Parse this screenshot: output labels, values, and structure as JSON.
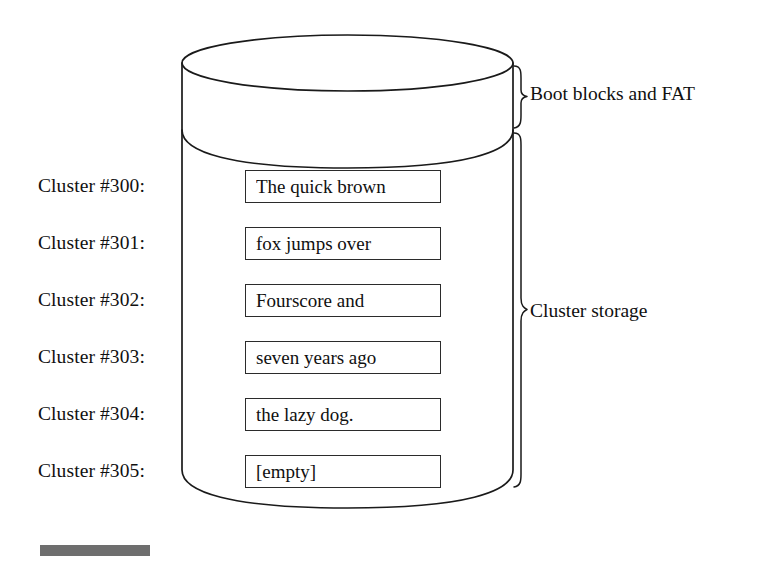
{
  "figure": {
    "background_color": "#ffffff",
    "line_color": "#1a1a1a"
  },
  "clusters": [
    {
      "label": "Cluster #300:",
      "content": "The quick brown"
    },
    {
      "label": "Cluster #301:",
      "content": "fox jumps over"
    },
    {
      "label": "Cluster #302:",
      "content": "Fourscore and"
    },
    {
      "label": "Cluster #303:",
      "content": "seven years ago"
    },
    {
      "label": "Cluster #304:",
      "content": "the lazy dog."
    },
    {
      "label": "Cluster #305:",
      "content": "[empty]"
    }
  ],
  "annotations": {
    "boot": "Boot blocks and FAT",
    "cluster_storage": "Cluster storage"
  }
}
